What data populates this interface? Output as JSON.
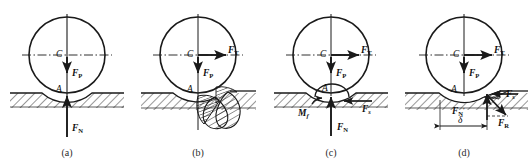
{
  "figure": {
    "width": 530,
    "height": 167,
    "stroke_color": "#1a1a1a",
    "background": "#ffffff"
  },
  "panels": [
    {
      "id": "a",
      "caption": "(a)",
      "caption_x": 67,
      "cx": 67,
      "description": "Undeformed contact: point contact with vertical load and normal reaction",
      "labels": [
        {
          "name": "center-label-c",
          "base": "C",
          "sub": "",
          "x": 56,
          "y": 57,
          "italic": true,
          "bold": false
        },
        {
          "name": "contact-point-label-a",
          "base": "A",
          "sub": "",
          "x": 56,
          "y": 92,
          "italic": true,
          "bold": false
        },
        {
          "name": "force-label-fp",
          "base": "F",
          "sub": "P",
          "x": 72,
          "y": 76,
          "italic": true,
          "bold": true
        },
        {
          "name": "force-label-fn",
          "base": "F",
          "sub": "N",
          "x": 72,
          "y": 131,
          "italic": true,
          "bold": true
        }
      ]
    },
    {
      "id": "b",
      "caption": "(b)",
      "caption_x": 198,
      "cx": 198,
      "description": "Driving force applied: material piles up ahead of the wheel forming a bulge",
      "labels": [
        {
          "name": "center-label-c",
          "base": "C",
          "sub": "",
          "x": 187,
          "y": 57,
          "italic": true,
          "bold": false
        },
        {
          "name": "contact-point-label-a",
          "base": "A",
          "sub": "",
          "x": 187,
          "y": 92,
          "italic": true,
          "bold": false
        },
        {
          "name": "force-label-ft",
          "base": "F",
          "sub": "T",
          "x": 228,
          "y": 53,
          "italic": true,
          "bold": true
        },
        {
          "name": "force-label-fp",
          "base": "F",
          "sub": "P",
          "x": 203,
          "y": 76,
          "italic": true,
          "bold": true
        }
      ]
    },
    {
      "id": "c",
      "caption": "(c)",
      "caption_x": 331,
      "cx": 331,
      "description": "Equivalent system: normal force, friction force and rolling resistance couple",
      "labels": [
        {
          "name": "center-label-c",
          "base": "C",
          "sub": "",
          "x": 320,
          "y": 57,
          "italic": true,
          "bold": false
        },
        {
          "name": "contact-point-label-a",
          "base": "A",
          "sub": "",
          "x": 322,
          "y": 91,
          "italic": true,
          "bold": false
        },
        {
          "name": "force-label-ft",
          "base": "F",
          "sub": "T",
          "x": 361,
          "y": 53,
          "italic": true,
          "bold": true
        },
        {
          "name": "force-label-fp",
          "base": "F",
          "sub": "P",
          "x": 336,
          "y": 76,
          "italic": true,
          "bold": true
        },
        {
          "name": "moment-label-mf",
          "base": "M",
          "sub": "f",
          "x": 302,
          "y": 114,
          "italic": true,
          "bold": true,
          "sub_italic": true
        },
        {
          "name": "force-label-fs",
          "base": "F",
          "sub": "s",
          "x": 364,
          "y": 110,
          "italic": true,
          "bold": true,
          "sub_italic": true
        },
        {
          "name": "force-label-fn",
          "base": "F",
          "sub": "N",
          "x": 337,
          "y": 129,
          "italic": true,
          "bold": true
        }
      ]
    },
    {
      "id": "d",
      "caption": "(d)",
      "caption_x": 464,
      "cx": 464,
      "description": "Resultant reaction offset by distance delta ahead of contact point",
      "labels": [
        {
          "name": "center-label-c",
          "base": "C",
          "sub": "",
          "x": 453,
          "y": 57,
          "italic": true,
          "bold": false
        },
        {
          "name": "contact-point-label-a",
          "base": "A",
          "sub": "",
          "x": 453,
          "y": 92,
          "italic": true,
          "bold": false
        },
        {
          "name": "force-label-ft",
          "base": "F",
          "sub": "T",
          "x": 494,
          "y": 53,
          "italic": true,
          "bold": true
        },
        {
          "name": "force-label-fp",
          "base": "F",
          "sub": "P",
          "x": 469,
          "y": 76,
          "italic": true,
          "bold": true
        },
        {
          "name": "force-label-fn-prime",
          "base": "F",
          "sub": "N",
          "prime": "′",
          "x": 455,
          "y": 113,
          "italic": true,
          "bold": true
        },
        {
          "name": "force-label-fs",
          "base": "F",
          "sub": "s",
          "x": 507,
          "y": 96,
          "italic": true,
          "bold": true,
          "sub_italic": true
        },
        {
          "name": "force-label-fr",
          "base": "F",
          "sub": "R",
          "x": 500,
          "y": 124,
          "italic": true,
          "bold": true
        },
        {
          "name": "dimension-label-delta",
          "base": "δ",
          "sub": "",
          "x": 455,
          "y": 128,
          "italic": true,
          "bold": false
        }
      ]
    }
  ],
  "geometry": {
    "circle_radius": 38,
    "circle_center_y": 55,
    "ground_line_y": 93,
    "hatch_depth": 14,
    "axis_dash": "4,2,1,2"
  },
  "captions": {
    "a": "(a)",
    "b": "(b)",
    "c": "(c)",
    "d": "(d)",
    "caption_y": 156
  }
}
